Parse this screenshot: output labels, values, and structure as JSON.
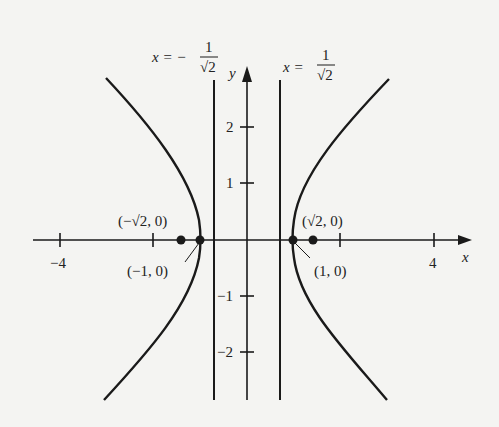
{
  "diagram": {
    "type": "hyperbola-graph",
    "axes": {
      "x_label": "x",
      "y_label": "y",
      "x_ticks": [
        {
          "value": -4,
          "label": "−4"
        },
        {
          "value": -2,
          "label": ""
        },
        {
          "value": 2,
          "label": ""
        },
        {
          "value": 4,
          "label": "4"
        }
      ],
      "y_ticks": [
        {
          "value": 2,
          "label": "2"
        },
        {
          "value": 1,
          "label": "1"
        },
        {
          "value": -1,
          "label": "−1"
        },
        {
          "value": -2,
          "label": "−2"
        }
      ]
    },
    "asymptote_labels": {
      "left": {
        "prefix": "x = −",
        "num": "1",
        "den": "√2"
      },
      "right": {
        "prefix": "x = ",
        "num": "1",
        "den": "√2"
      }
    },
    "points": [
      {
        "label": "(−√2, 0)",
        "x": -1.414
      },
      {
        "label": "(−1, 0)",
        "x": -1
      },
      {
        "label": "(1, 0)",
        "x": 1
      },
      {
        "label": "(√2, 0)",
        "x": 1.414
      }
    ],
    "colors": {
      "ink": "#1a1a1a",
      "background": "#f4f4f2"
    }
  }
}
